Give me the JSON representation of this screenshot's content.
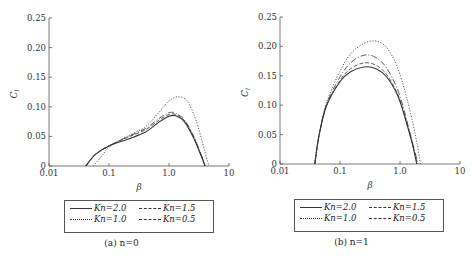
{
  "chart_data": [
    {
      "type": "line",
      "panel": "a",
      "caption": "(a) n=0",
      "xlabel": "β",
      "ylabel": "C_l",
      "xscale": "log",
      "xlim": [
        0.01,
        10
      ],
      "ylim": [
        0,
        0.25
      ],
      "xticks": [
        "0.01",
        "0.1",
        "1.0",
        "10"
      ],
      "yticks": [
        "0",
        "0.05",
        "0.10",
        "0.15",
        "0.20",
        "0.25"
      ],
      "legend_position": "below",
      "series": [
        {
          "name": "Kn=2.0",
          "style": "solid",
          "x": [
            0.041,
            0.06,
            0.1,
            0.2,
            0.4,
            0.7,
            1.0,
            1.3,
            1.8,
            2.5,
            3.2,
            4.0
          ],
          "y": [
            0,
            0.02,
            0.034,
            0.045,
            0.057,
            0.075,
            0.084,
            0.085,
            0.075,
            0.05,
            0.025,
            0
          ]
        },
        {
          "name": "Kn=1.5",
          "style": "dashed",
          "x": [
            0.041,
            0.06,
            0.1,
            0.2,
            0.4,
            0.7,
            1.0,
            1.3,
            1.8,
            2.5,
            3.2,
            4.0
          ],
          "y": [
            0,
            0.02,
            0.034,
            0.048,
            0.061,
            0.078,
            0.087,
            0.087,
            0.077,
            0.052,
            0.026,
            0
          ]
        },
        {
          "name": "Kn=1.0",
          "style": "dotted",
          "x": [
            0.055,
            0.08,
            0.1,
            0.2,
            0.4,
            0.7,
            1.0,
            1.4,
            2.0,
            2.8,
            3.6,
            4.6
          ],
          "y": [
            0,
            0.02,
            0.032,
            0.05,
            0.066,
            0.092,
            0.11,
            0.117,
            0.11,
            0.078,
            0.04,
            0
          ]
        },
        {
          "name": "Kn=0.5",
          "style": "dashdot",
          "x": [
            0.041,
            0.06,
            0.1,
            0.2,
            0.4,
            0.7,
            1.0,
            1.3,
            1.8,
            2.5,
            3.2,
            4.0
          ],
          "y": [
            0,
            0.02,
            0.034,
            0.049,
            0.063,
            0.081,
            0.09,
            0.089,
            0.078,
            0.053,
            0.027,
            0
          ]
        }
      ]
    },
    {
      "type": "line",
      "panel": "b",
      "caption": "(b) n=1",
      "xlabel": "β",
      "ylabel": "C_l",
      "xscale": "log",
      "xlim": [
        0.01,
        10
      ],
      "ylim": [
        0,
        0.25
      ],
      "xticks": [
        "0.01",
        "0.1",
        "1.0",
        "10"
      ],
      "yticks": [
        "0",
        "0.05",
        "0.10",
        "0.15",
        "0.20",
        "0.25"
      ],
      "legend_position": "below",
      "series": [
        {
          "name": "Kn=2.0",
          "style": "solid",
          "x": [
            0.038,
            0.045,
            0.06,
            0.1,
            0.15,
            0.25,
            0.4,
            0.6,
            0.9,
            1.2,
            1.6,
            1.9
          ],
          "y": [
            0,
            0.05,
            0.1,
            0.14,
            0.157,
            0.165,
            0.162,
            0.148,
            0.118,
            0.08,
            0.035,
            0
          ]
        },
        {
          "name": "Kn=1.5",
          "style": "dashed",
          "x": [
            0.038,
            0.045,
            0.06,
            0.1,
            0.15,
            0.25,
            0.4,
            0.6,
            0.9,
            1.2,
            1.6,
            1.95
          ],
          "y": [
            0,
            0.05,
            0.1,
            0.142,
            0.162,
            0.172,
            0.168,
            0.152,
            0.12,
            0.082,
            0.036,
            0
          ]
        },
        {
          "name": "Kn=1.0",
          "style": "dotted",
          "x": [
            0.038,
            0.045,
            0.06,
            0.1,
            0.15,
            0.25,
            0.4,
            0.6,
            0.9,
            1.3,
            1.8,
            2.2
          ],
          "y": [
            0,
            0.05,
            0.105,
            0.158,
            0.187,
            0.205,
            0.209,
            0.198,
            0.165,
            0.112,
            0.05,
            0
          ]
        },
        {
          "name": "Kn=0.5",
          "style": "dashdot",
          "x": [
            0.038,
            0.045,
            0.06,
            0.1,
            0.15,
            0.25,
            0.4,
            0.6,
            0.9,
            1.2,
            1.6,
            2.0
          ],
          "y": [
            0,
            0.05,
            0.102,
            0.148,
            0.172,
            0.185,
            0.181,
            0.163,
            0.128,
            0.087,
            0.038,
            0
          ]
        }
      ]
    }
  ],
  "legend": {
    "items": [
      {
        "label": "Kn=2.0",
        "style": "solid"
      },
      {
        "label": "Kn=1.5",
        "style": "dashed"
      },
      {
        "label": "Kn=1.0",
        "style": "dotted"
      },
      {
        "label": "Kn=0.5",
        "style": "dashdot"
      }
    ]
  },
  "panels": {
    "a": {
      "caption": "(a) n=0"
    },
    "b": {
      "caption": "(b) n=1"
    }
  },
  "colors": {
    "axis": "#555555",
    "line": "#333333"
  }
}
